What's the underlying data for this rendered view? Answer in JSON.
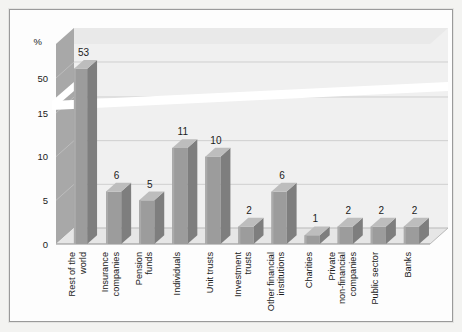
{
  "chart_data": {
    "type": "bar",
    "title": "",
    "subtitle": "",
    "xlabel": "",
    "ylabel": "%",
    "categories": [
      "Rest of the world",
      "Insurance companies",
      "Pension funds",
      "Individuals",
      "Unit trusts",
      "Investment trusts",
      "Other financial institutions",
      "Charities",
      "Private non-financial companies",
      "Public sector",
      "Banks"
    ],
    "category_lines": [
      [
        "Rest of the",
        "world"
      ],
      [
        "Insurance",
        "companies"
      ],
      [
        "Pension",
        "funds"
      ],
      [
        "Individuals"
      ],
      [
        "Unit trusts"
      ],
      [
        "Investment",
        "trusts"
      ],
      [
        "Other financial",
        "institutions"
      ],
      [
        "Charities"
      ],
      [
        "Private",
        "non-financial",
        "companies"
      ],
      [
        "Public sector"
      ],
      [
        "Banks"
      ]
    ],
    "values": [
      53,
      6,
      5,
      11,
      10,
      2,
      6,
      1,
      2,
      2,
      2
    ],
    "value_labels": [
      "53",
      "6",
      "5",
      "11",
      "10",
      "2",
      "6",
      "1",
      "2",
      "2",
      "2"
    ],
    "yticks": [
      "0",
      "5",
      "10",
      "15",
      "50"
    ],
    "ytick_values": [
      0,
      5,
      10,
      15,
      50
    ],
    "ylim": [
      0,
      55
    ],
    "axis_break": true,
    "axis_break_note": "y-axis broken between 15 and 50",
    "grid": true,
    "legend": "none",
    "style": "3d-column",
    "colors": {
      "bar_face": "#9c9c9c",
      "bar_side": "#7e7e7e",
      "bar_top": "#bdbdbd",
      "plot_background": "#f0f0f0",
      "wall_side": "#a8a8a8",
      "gridline": "#cfcfcf",
      "frame_border": "#9a9a9a",
      "page_background": "#f3f3f1",
      "text": "#1b1b1b"
    }
  }
}
